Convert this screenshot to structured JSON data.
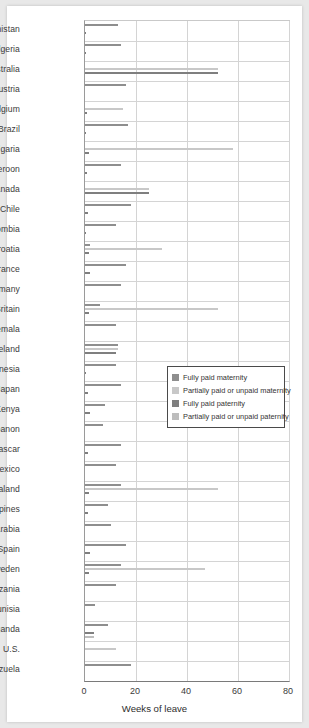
{
  "chart_data": {
    "type": "bar",
    "orientation": "horizontal",
    "title": "",
    "xlabel": "Weeks of leave",
    "ylabel": "",
    "xlim": [
      0,
      80
    ],
    "xticks": [
      0,
      20,
      40,
      60,
      80
    ],
    "grid": true,
    "legend_position": "center-right",
    "categories": [
      "Afghanistan",
      "Algeria",
      "Australia",
      "Austria",
      "Belgium",
      "Brazil",
      "Bulgaria",
      "Cameroon",
      "Canada",
      "Chile",
      "Colombia",
      "Croatia",
      "France",
      "Germany",
      "Great Britain",
      "Guatemala",
      "Iceland",
      "Indonesia",
      "Japan",
      "Kenya",
      "Lebanon",
      "Madagascar",
      "Mexico",
      "New Zealand",
      "Philippines",
      "Saudi Arabia",
      "Spain",
      "Sweden",
      "Tanzania",
      "Tunisia",
      "Uganda",
      "U.S.",
      "Venezuela"
    ],
    "series": [
      {
        "name": "Fully paid maternity",
        "color": "#8e8e8e",
        "values": [
          13,
          14,
          0,
          16,
          0,
          17,
          0,
          14,
          0,
          18,
          12,
          2,
          16,
          14,
          6,
          12,
          13,
          12,
          14,
          8,
          7,
          14,
          12,
          14,
          9,
          10,
          16,
          14,
          12,
          4,
          9,
          0,
          18
        ]
      },
      {
        "name": "Partially paid or unpaid maternity",
        "color": "#c8c8c8",
        "values": [
          0,
          0,
          52,
          0,
          15,
          0,
          58,
          0,
          25,
          0,
          0,
          30,
          0,
          0,
          52,
          0,
          13,
          0,
          0,
          0,
          0,
          0,
          0,
          52,
          0,
          0,
          0,
          47,
          0,
          0,
          0,
          12,
          0
        ]
      },
      {
        "name": "Fully paid paternity",
        "color": "#7f7f7f",
        "values": [
          0.4,
          0.3,
          52,
          0,
          0.6,
          0.4,
          1.4,
          0.6,
          25,
          1,
          0.5,
          1.5,
          2,
          0,
          1.4,
          0,
          12,
          0.5,
          1,
          2,
          0,
          1,
          0,
          1.4,
          1,
          0,
          2,
          1.4,
          0,
          0,
          3.5,
          0,
          0
        ]
      },
      {
        "name": "Partially paid or unpaid paternity",
        "color": "#bdbdbd",
        "values": [
          0,
          0,
          0,
          0,
          0,
          0,
          0,
          0,
          0,
          0,
          0,
          0,
          0,
          0,
          0,
          0,
          0,
          0,
          0,
          0,
          0,
          0,
          0,
          0,
          0,
          0,
          0,
          0,
          0,
          0,
          3.5,
          0,
          0
        ]
      }
    ]
  },
  "legend": {
    "items": [
      {
        "label": "Fully paid maternity",
        "color": "#8e8e8e"
      },
      {
        "label": "Partially paid or unpaid maternity",
        "color": "#c8c8c8"
      },
      {
        "label": "Fully paid paternity",
        "color": "#7f7f7f"
      },
      {
        "label": "Partially paid or unpaid paternity",
        "color": "#bdbdbd"
      }
    ]
  },
  "axis": {
    "x_title": "Weeks of leave",
    "x_ticks": [
      "0",
      "20",
      "40",
      "60",
      "80"
    ]
  }
}
